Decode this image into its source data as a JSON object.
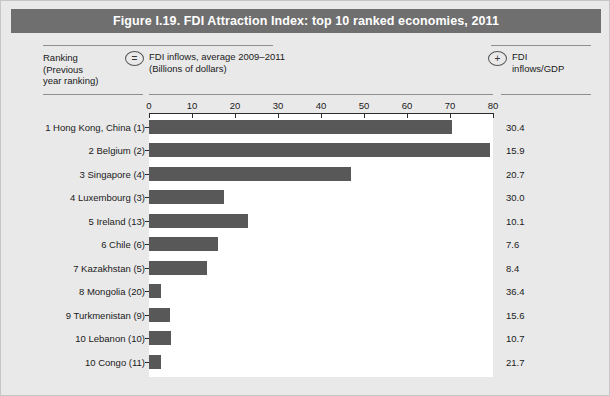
{
  "figure": {
    "title": "Figure I.19. FDI Attraction Index: top 10 ranked economies, 2011"
  },
  "legend": {
    "ranking_label": "Ranking\n(Previous\nyear ranking)",
    "ranking_line1": "Ranking",
    "ranking_line2": "(Previous",
    "ranking_line3": "year ranking)",
    "equals_symbol": "=",
    "plus_symbol": "+",
    "series_line1": "FDI inflows, average 2009–2011",
    "series_line2": "(Billions of dollars)",
    "gdp_line1": "FDI",
    "gdp_line2": "inflows/GDP"
  },
  "colors": {
    "bar": "#585858",
    "title_bar": "#6f6f6f",
    "page_background": "#e9e9e9",
    "plot_background": "#ffffff",
    "axis": "#2b2b2b"
  },
  "chart_data": {
    "type": "bar",
    "orientation": "horizontal",
    "title": "Figure I.19. FDI Attraction Index: top 10 ranked economies, 2011",
    "xlabel": "FDI inflows, average 2009–2011 (Billions of dollars)",
    "ylabel": "Ranking (Previous year ranking)",
    "xlim": [
      0,
      80
    ],
    "xticks": [
      0,
      10,
      20,
      30,
      40,
      50,
      60,
      70,
      80
    ],
    "grid": false,
    "legend_position": "top",
    "categories": [
      "1 Hong Kong, China (1)",
      "2 Belgium (2)",
      "3 Singapore (4)",
      "4 Luxembourg (3)",
      "5 Ireland (13)",
      "6 Chile (6)",
      "7 Kazakhstan (5)",
      "8 Mongolia (20)",
      "9 Turkmenistan (9)",
      "10 Lebanon (10)",
      "10 Congo (11)"
    ],
    "series": [
      {
        "name": "FDI inflows, average 2009–2011 (Billions of dollars)",
        "symbol": "=",
        "values": [
          70.5,
          79.3,
          47.0,
          17.4,
          23.0,
          16.0,
          13.5,
          2.8,
          4.8,
          5.1,
          2.8
        ]
      },
      {
        "name": "FDI inflows/GDP",
        "symbol": "+",
        "values": [
          30.4,
          15.9,
          20.7,
          30.0,
          10.1,
          7.6,
          8.4,
          36.4,
          15.6,
          10.7,
          21.7
        ],
        "labels": [
          "30.4",
          "15.9",
          "20.7",
          "30.0",
          "10.1",
          "7.6",
          "8.4",
          "36.4",
          "15.6",
          "10.7",
          "21.7"
        ]
      }
    ]
  }
}
